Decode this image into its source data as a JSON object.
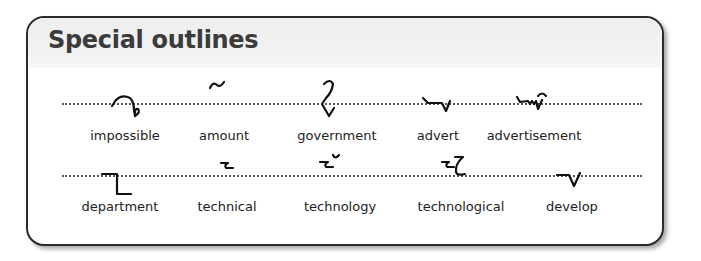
{
  "title": "Special outlines",
  "rows": [
    {
      "items": [
        {
          "word": "impossible",
          "outline_icon": "impossible-outline"
        },
        {
          "word": "amount",
          "outline_icon": "amount-outline"
        },
        {
          "word": "government",
          "outline_icon": "government-outline"
        },
        {
          "word": "advert",
          "outline_icon": "advert-outline"
        },
        {
          "word": "advertisement",
          "outline_icon": "advertisement-outline"
        }
      ]
    },
    {
      "items": [
        {
          "word": "department",
          "outline_icon": "department-outline"
        },
        {
          "word": "technical",
          "outline_icon": "technical-outline"
        },
        {
          "word": "technology",
          "outline_icon": "technology-outline"
        },
        {
          "word": "technological",
          "outline_icon": "technological-outline"
        },
        {
          "word": "develop",
          "outline_icon": "develop-outline"
        }
      ]
    }
  ],
  "colors": {
    "border": "#2a2a2a",
    "header_bg": "#efefef",
    "text": "#222222",
    "title": "#3b3b3b"
  }
}
